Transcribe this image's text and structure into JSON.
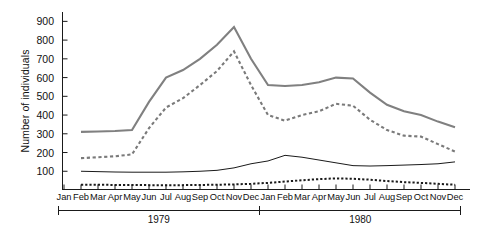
{
  "chart_data": {
    "type": "line",
    "title": "",
    "xlabel": "",
    "ylabel": "Number of individuals",
    "ylim": [
      0,
      950
    ],
    "yticks": [
      100,
      200,
      300,
      400,
      500,
      600,
      700,
      800,
      900
    ],
    "grid": false,
    "legend_position": "none",
    "x": [
      "Jan",
      "Feb",
      "Mar",
      "Apr",
      "May",
      "Jun",
      "Jul",
      "Aug",
      "Sep",
      "Oct",
      "Nov",
      "Dec",
      "Jan",
      "Feb",
      "Mar",
      "Apr",
      "May",
      "Jun",
      "Jul",
      "Aug",
      "Sep",
      "Oct",
      "Nov",
      "Dec"
    ],
    "x_groups": [
      {
        "label": "1979",
        "start": "Jan",
        "end": "Dec"
      },
      {
        "label": "1980",
        "start": "Jan",
        "end": "Dec"
      }
    ],
    "series": [
      {
        "name": "total",
        "style": "solid",
        "color": "#808080",
        "width": 2.1,
        "values": [
          null,
          310,
          312,
          315,
          320,
          470,
          600,
          640,
          700,
          775,
          870,
          700,
          560,
          555,
          560,
          575,
          600,
          595,
          520,
          455,
          420,
          400,
          365,
          335
        ]
      },
      {
        "name": "adults",
        "style": "dashed",
        "color": "#7a7a7a",
        "width": 2.1,
        "values": [
          null,
          170,
          175,
          180,
          190,
          330,
          440,
          490,
          560,
          635,
          740,
          560,
          400,
          370,
          400,
          420,
          460,
          450,
          375,
          320,
          290,
          285,
          245,
          205
        ]
      },
      {
        "name": "juveniles",
        "style": "solid",
        "color": "#1a1a1a",
        "width": 1.0,
        "values": [
          null,
          100,
          98,
          96,
          95,
          95,
          95,
          97,
          100,
          105,
          118,
          140,
          155,
          185,
          175,
          160,
          145,
          130,
          128,
          130,
          133,
          136,
          140,
          150
        ]
      },
      {
        "name": "young",
        "style": "dotted",
        "color": "#1a1a1a",
        "width": 2.0,
        "values": [
          null,
          28,
          28,
          27,
          27,
          26,
          26,
          26,
          27,
          28,
          30,
          33,
          38,
          45,
          52,
          58,
          62,
          60,
          55,
          48,
          42,
          38,
          33,
          28
        ]
      }
    ]
  }
}
